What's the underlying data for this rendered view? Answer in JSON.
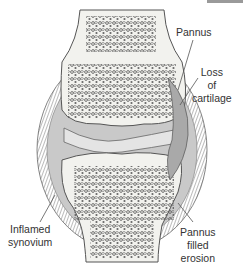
{
  "diagram": {
    "title": "",
    "colors": {
      "bone_fill": "#f2f2ee",
      "trabecular": "#5a5a5a",
      "capsule": "#8a8a8a",
      "synovium": "#b9b9b9",
      "joint_space": "#cfcfcf",
      "text": "#333333",
      "leader_line": "#555555"
    },
    "labels": {
      "pannus": "Pannus",
      "loss_of_cartilage": [
        "Loss",
        "of",
        "cartilage"
      ],
      "inflamed_synovium": [
        "Inflamed",
        "synovium"
      ],
      "pannus_filled_erosion": [
        "Pannus",
        "filled",
        "erosion"
      ]
    }
  }
}
